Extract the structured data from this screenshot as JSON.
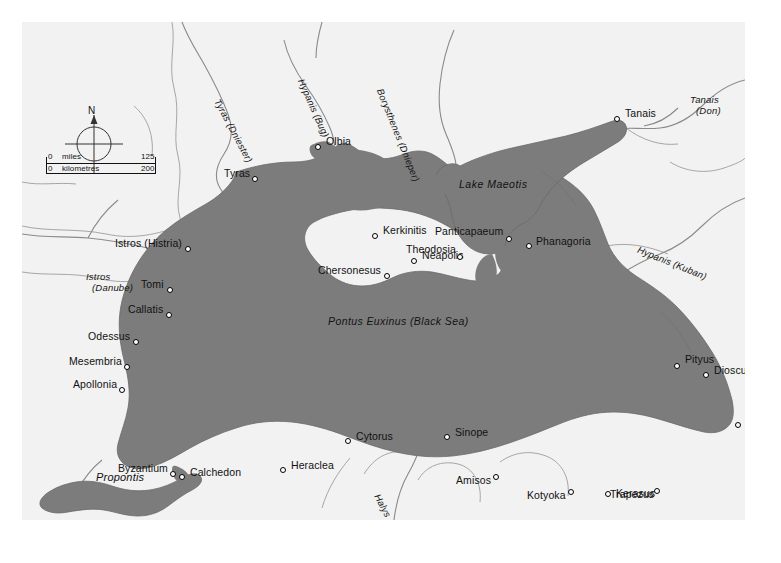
{
  "map": {
    "title": "Pontus Euxinus (Black Sea)",
    "sea_label": "Pontus Euxinus (Black Sea)",
    "lake_label": "Lake Maeotis",
    "propontis_label": "Propontis",
    "colors": {
      "sea": "#7c7c7c",
      "land": "#f2f2f2",
      "coast_line": "#6f6f6f",
      "border_line": "#9a9a9a",
      "river_line": "#8d8d8d",
      "text": "#111111",
      "page_background": "#ffffff"
    },
    "compass": {
      "north_label": "N"
    },
    "scale": {
      "miles_label": "miles",
      "miles_min": "0",
      "miles_max": "125",
      "km_label": "kilometres",
      "km_min": "0",
      "km_max": "200"
    },
    "cities": [
      {
        "name": "Olbia",
        "x": 296,
        "y": 125,
        "lx": 304,
        "ly": 120,
        "align": "left"
      },
      {
        "name": "Tyras",
        "x": 233,
        "y": 157,
        "lx": 228,
        "ly": 152,
        "align": "right"
      },
      {
        "name": "Tanais",
        "x": 595,
        "y": 97,
        "lx": 603,
        "ly": 92,
        "align": "left"
      },
      {
        "name": "Istros (Histria)",
        "x": 166,
        "y": 227,
        "lx": 160,
        "ly": 222,
        "align": "right"
      },
      {
        "name": "Tomi",
        "x": 148,
        "y": 268,
        "lx": 142,
        "ly": 263,
        "align": "right"
      },
      {
        "name": "Callatis",
        "x": 147,
        "y": 293,
        "lx": 141,
        "ly": 288,
        "align": "right"
      },
      {
        "name": "Odessus",
        "x": 114,
        "y": 320,
        "lx": 108,
        "ly": 315,
        "align": "right"
      },
      {
        "name": "Mesembria",
        "x": 105,
        "y": 345,
        "lx": 100,
        "ly": 340,
        "align": "right"
      },
      {
        "name": "Apollonia",
        "x": 100,
        "y": 368,
        "lx": 95,
        "ly": 363,
        "align": "right"
      },
      {
        "name": "Byzantium",
        "x": 151,
        "y": 452,
        "lx": 146,
        "ly": 447,
        "align": "right"
      },
      {
        "name": "Calchedon",
        "x": 160,
        "y": 455,
        "lx": 168,
        "ly": 451,
        "align": "left"
      },
      {
        "name": "Kerkinitis",
        "x": 353,
        "y": 214,
        "lx": 361,
        "ly": 209,
        "align": "left"
      },
      {
        "name": "Neapolis",
        "x": 392,
        "y": 239,
        "lx": 400,
        "ly": 234,
        "align": "left"
      },
      {
        "name": "Chersonesus",
        "x": 365,
        "y": 254,
        "lx": 359,
        "ly": 249,
        "align": "right"
      },
      {
        "name": "Panticapaeum",
        "x": 487,
        "y": 217,
        "lx": 481,
        "ly": 210,
        "align": "right"
      },
      {
        "name": "Theodosia",
        "x": 438,
        "y": 235,
        "lx": 434,
        "ly": 228,
        "align": "right"
      },
      {
        "name": "Phanagoria",
        "x": 507,
        "y": 224,
        "lx": 514,
        "ly": 220,
        "align": "left"
      },
      {
        "name": "Pityus",
        "x": 655,
        "y": 344,
        "lx": 663,
        "ly": 338,
        "align": "left"
      },
      {
        "name": "Dioscurias",
        "x": 684,
        "y": 353,
        "lx": 692,
        "ly": 349,
        "align": "left"
      },
      {
        "name": "Phasis",
        "x": 716,
        "y": 403,
        "lx": 724,
        "ly": 396,
        "align": "left"
      },
      {
        "name": "Cytorus",
        "x": 326,
        "y": 419,
        "lx": 334,
        "ly": 415,
        "align": "left"
      },
      {
        "name": "Sinope",
        "x": 425,
        "y": 415,
        "lx": 433,
        "ly": 411,
        "align": "left"
      },
      {
        "name": "Heraclea",
        "x": 261,
        "y": 448,
        "lx": 269,
        "ly": 444,
        "align": "left"
      },
      {
        "name": "Amisos",
        "x": 474,
        "y": 455,
        "lx": 469,
        "ly": 459,
        "align": "right"
      },
      {
        "name": "Kotyoka",
        "x": 549,
        "y": 470,
        "lx": 544,
        "ly": 474,
        "align": "right"
      },
      {
        "name": "Kerasus",
        "x": 586,
        "y": 472,
        "lx": 594,
        "ly": 472,
        "align": "left"
      },
      {
        "name": "Trapezus",
        "x": 635,
        "y": 469,
        "lx": 632,
        "ly": 473,
        "align": "right"
      }
    ],
    "rivers": [
      {
        "name": "Tyras (Dniester)",
        "x": 200,
        "y": 75,
        "rotate": 62,
        "lines": [
          "Tyras (Dniester)"
        ]
      },
      {
        "name": "Hypanis (Bug)",
        "x": 284,
        "y": 55,
        "rotate": 66,
        "lines": [
          "Hypanis (Bug)"
        ]
      },
      {
        "name": "Borysthenes (Dnieper)",
        "x": 363,
        "y": 65,
        "rotate": 68,
        "lines": [
          "Borysthenes (Dnieper)"
        ]
      },
      {
        "name": "Tanais (Don)",
        "x": 668,
        "y": 72,
        "rotate": 0,
        "lines": [
          "Tanais",
          "(Don)"
        ]
      },
      {
        "name": "Hypanis (Kuban)",
        "x": 618,
        "y": 222,
        "rotate": 22,
        "lines": [
          "Hypanis (Kuban)"
        ]
      },
      {
        "name": "Istros (Danube)",
        "x": 64,
        "y": 249,
        "rotate": 0,
        "lines": [
          "Istros",
          "(Danube)"
        ]
      },
      {
        "name": "Halys",
        "x": 360,
        "y": 470,
        "rotate": 62,
        "lines": [
          "Halys"
        ]
      }
    ]
  }
}
